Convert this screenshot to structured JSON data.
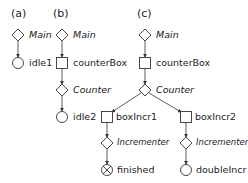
{
  "panels": {
    "a": {
      "label": "(a)",
      "nodes": [
        {
          "shape": "diamond",
          "text": "Main"
        },
        {
          "shape": "circle",
          "text": "idle1"
        }
      ]
    },
    "b": {
      "label": "(b)",
      "nodes": [
        {
          "shape": "diamond",
          "text": "Main"
        },
        {
          "shape": "square",
          "text": "counterBox"
        },
        {
          "shape": "diamond",
          "text": "Counter"
        },
        {
          "shape": "circle",
          "text": "idle2"
        }
      ]
    },
    "c": {
      "label": "(c)",
      "nodes": [
        {
          "shape": "diamond",
          "text": "Main"
        },
        {
          "shape": "square",
          "text": "counterBox"
        },
        {
          "shape": "diamond",
          "text": "Counter"
        }
      ],
      "left": [
        {
          "shape": "square",
          "text": "boxIncr1"
        },
        {
          "shape": "diamond",
          "text": "Incrementer"
        },
        {
          "shape": "crossed-circle",
          "text": "finished"
        }
      ],
      "right": [
        {
          "shape": "square",
          "text": "boxIncr2"
        },
        {
          "shape": "diamond",
          "text": "Incrementer"
        },
        {
          "shape": "circle",
          "text": "doubleIncr"
        }
      ]
    }
  }
}
